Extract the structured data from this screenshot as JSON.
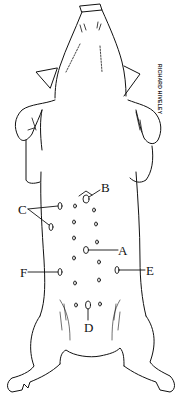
{
  "diagram": {
    "signature": "RICHARD HIVELEY",
    "labels": [
      {
        "id": "A",
        "text": "A"
      },
      {
        "id": "B",
        "text": "B"
      },
      {
        "id": "C",
        "text": "C"
      },
      {
        "id": "D",
        "text": "D"
      },
      {
        "id": "E",
        "text": "E"
      },
      {
        "id": "F",
        "text": "F"
      }
    ],
    "colors": {
      "ink": "#111111",
      "background": "#ffffff"
    }
  }
}
